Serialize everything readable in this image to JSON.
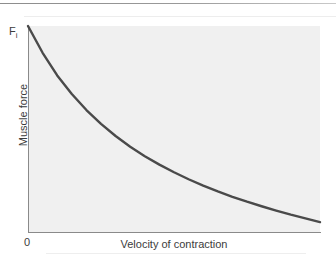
{
  "figure": {
    "name": "force-velocity-relationship",
    "background_color": "#ffffff",
    "plot_background_color": "#f0f0f0",
    "axis_color": "#8a8a8a",
    "curve_color": "#4a4a4a"
  },
  "labels": {
    "y_axis_title": "Muscle force",
    "x_axis_title": "Velocity of contraction",
    "origin": "0",
    "y_max_symbol": "F",
    "y_max_subscript": "i"
  },
  "chart_data": {
    "type": "line",
    "title": "",
    "subtitle": "",
    "xlabel": "Velocity of contraction",
    "ylabel": "Muscle force",
    "grid": false,
    "legend": "none",
    "xlim": [
      0,
      1
    ],
    "ylim": [
      0,
      1
    ],
    "xticks": [
      0
    ],
    "xticklabels": [
      "0"
    ],
    "yticks": [
      1
    ],
    "yticklabels": [
      "Fi"
    ],
    "annotations": [
      {
        "text": "Fi",
        "x": 0,
        "y": 1,
        "note": "maximum isometric force at zero velocity"
      },
      {
        "text": "0",
        "x": 0,
        "y": 0,
        "note": "origin"
      }
    ],
    "series": [
      {
        "name": "force-velocity curve",
        "color": "#4a4a4a",
        "linewidth": 2.4,
        "x": [
          0.0,
          0.05,
          0.1,
          0.15,
          0.2,
          0.25,
          0.3,
          0.35,
          0.4,
          0.45,
          0.5,
          0.55,
          0.6,
          0.65,
          0.7,
          0.75,
          0.8,
          0.85,
          0.9,
          0.95,
          1.0
        ],
        "y": [
          1.0,
          0.87,
          0.76,
          0.67,
          0.592,
          0.525,
          0.466,
          0.414,
          0.368,
          0.327,
          0.29,
          0.256,
          0.225,
          0.197,
          0.171,
          0.147,
          0.125,
          0.104,
          0.084,
          0.066,
          0.048
        ]
      }
    ]
  },
  "curve_path": "M 29.2 33.0 C 37 62 48 92 62 116 C 80 147 104 170 134 188 C 170 209 215 223 262 229 C 283 231 305 232 320 232"
}
